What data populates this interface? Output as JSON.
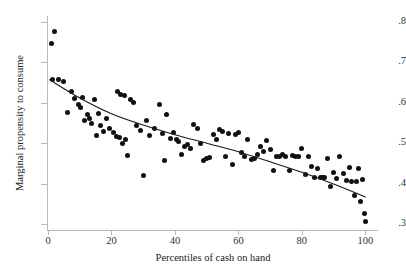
{
  "chart_data": {
    "type": "scatter",
    "title": "",
    "xlabel": "Percentiles of cash on hand",
    "ylabel": "Marginal propensity to consume",
    "xlim": [
      0,
      104
    ],
    "ylim": [
      0.285,
      0.815
    ],
    "xticks": [
      0,
      20,
      40,
      60,
      80,
      100
    ],
    "xtick_labels": [
      "0",
      "20",
      "40",
      "60",
      "80",
      "100"
    ],
    "yticks": [
      0.3,
      0.4,
      0.5,
      0.6,
      0.7,
      0.8
    ],
    "ytick_labels": [
      ".3",
      ".4",
      ".5",
      ".6",
      ".7",
      ".8"
    ],
    "grid": false,
    "legend": false,
    "marker_color": "#111111",
    "axis_color": "#b9b9b9",
    "fit_line_color": "#1a1a1a",
    "series": [
      {
        "name": "Marginal propensity to consume by percentile of cash on hand",
        "marker": "circle",
        "points": [
          [
            1.2,
            0.748
          ],
          [
            2.2,
            0.777
          ],
          [
            1.5,
            0.658
          ],
          [
            3.2,
            0.657
          ],
          [
            5.0,
            0.652
          ],
          [
            6.0,
            0.575
          ],
          [
            7.5,
            0.627
          ],
          [
            8.5,
            0.61
          ],
          [
            9.5,
            0.596
          ],
          [
            10.2,
            0.588
          ],
          [
            10.8,
            0.613
          ],
          [
            11.5,
            0.555
          ],
          [
            12.5,
            0.572
          ],
          [
            13.0,
            0.56
          ],
          [
            13.8,
            0.548
          ],
          [
            14.5,
            0.608
          ],
          [
            15.2,
            0.518
          ],
          [
            15.8,
            0.573
          ],
          [
            16.5,
            0.545
          ],
          [
            17.5,
            0.53
          ],
          [
            18.5,
            0.562
          ],
          [
            19.5,
            0.536
          ],
          [
            20.5,
            0.526
          ],
          [
            21.5,
            0.517
          ],
          [
            22.0,
            0.627
          ],
          [
            22.5,
            0.515
          ],
          [
            23.0,
            0.62
          ],
          [
            23.5,
            0.498
          ],
          [
            24.0,
            0.619
          ],
          [
            24.5,
            0.509
          ],
          [
            25.0,
            0.47
          ],
          [
            26.0,
            0.608
          ],
          [
            27.0,
            0.601
          ],
          [
            28.0,
            0.545
          ],
          [
            29.0,
            0.532
          ],
          [
            30.0,
            0.42
          ],
          [
            31.0,
            0.555
          ],
          [
            32.0,
            0.519
          ],
          [
            33.5,
            0.536
          ],
          [
            35.0,
            0.596
          ],
          [
            36.0,
            0.525
          ],
          [
            36.8,
            0.456
          ],
          [
            37.5,
            0.57
          ],
          [
            38.5,
            0.512
          ],
          [
            39.5,
            0.527
          ],
          [
            40.5,
            0.51
          ],
          [
            41.0,
            0.505
          ],
          [
            42.0,
            0.472
          ],
          [
            43.0,
            0.492
          ],
          [
            44.0,
            0.496
          ],
          [
            45.0,
            0.487
          ],
          [
            46.0,
            0.546
          ],
          [
            47.0,
            0.536
          ],
          [
            48.0,
            0.499
          ],
          [
            49.0,
            0.458
          ],
          [
            50.0,
            0.461
          ],
          [
            51.0,
            0.465
          ],
          [
            52.0,
            0.522
          ],
          [
            53.0,
            0.508
          ],
          [
            54.0,
            0.534
          ],
          [
            55.0,
            0.53
          ],
          [
            56.0,
            0.466
          ],
          [
            57.0,
            0.523
          ],
          [
            58.0,
            0.446
          ],
          [
            59.0,
            0.521
          ],
          [
            60.0,
            0.527
          ],
          [
            61.0,
            0.476
          ],
          [
            62.0,
            0.466
          ],
          [
            63.0,
            0.509
          ],
          [
            64.0,
            0.46
          ],
          [
            65.0,
            0.463
          ],
          [
            66.0,
            0.472
          ],
          [
            67.0,
            0.492
          ],
          [
            68.0,
            0.48
          ],
          [
            69.0,
            0.506
          ],
          [
            70.0,
            0.484
          ],
          [
            71.0,
            0.432
          ],
          [
            72.0,
            0.468
          ],
          [
            73.0,
            0.468
          ],
          [
            74.0,
            0.471
          ],
          [
            75.0,
            0.468
          ],
          [
            76.0,
            0.432
          ],
          [
            77.0,
            0.47
          ],
          [
            78.0,
            0.468
          ],
          [
            79.0,
            0.467
          ],
          [
            80.0,
            0.487
          ],
          [
            81.0,
            0.423
          ],
          [
            82.0,
            0.466
          ],
          [
            83.0,
            0.442
          ],
          [
            84.0,
            0.414
          ],
          [
            85.0,
            0.438
          ],
          [
            85.8,
            0.414
          ],
          [
            86.5,
            0.414
          ],
          [
            87.2,
            0.414
          ],
          [
            88.0,
            0.461
          ],
          [
            89.0,
            0.392
          ],
          [
            90.0,
            0.428
          ],
          [
            91.0,
            0.413
          ],
          [
            92.0,
            0.467
          ],
          [
            93.0,
            0.424
          ],
          [
            94.0,
            0.408
          ],
          [
            95.0,
            0.441
          ],
          [
            95.8,
            0.406
          ],
          [
            96.5,
            0.37
          ],
          [
            97.2,
            0.404
          ],
          [
            97.8,
            0.438
          ],
          [
            98.5,
            0.355
          ],
          [
            99.2,
            0.409
          ],
          [
            99.8,
            0.327
          ],
          [
            100.0,
            0.306
          ]
        ]
      }
    ],
    "fit_line": {
      "name": "fitted trend",
      "points": [
        [
          0.5,
          0.657
        ],
        [
          10,
          0.612
        ],
        [
          20,
          0.573
        ],
        [
          30,
          0.545
        ],
        [
          40,
          0.521
        ],
        [
          50,
          0.5
        ],
        [
          60,
          0.479
        ],
        [
          70,
          0.454
        ],
        [
          80,
          0.428
        ],
        [
          90,
          0.399
        ],
        [
          100,
          0.367
        ]
      ]
    }
  }
}
